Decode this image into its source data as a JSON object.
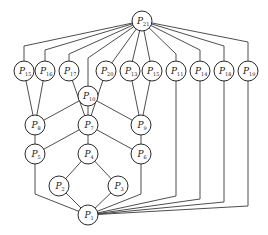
{
  "diagram": {
    "type": "hasse-diagram",
    "node_radius": 10,
    "nodes": [
      {
        "id": "P21",
        "base": "P",
        "sub": "21",
        "x": 142,
        "y": 21
      },
      {
        "id": "P15a",
        "base": "P",
        "sub": "15",
        "x": 24,
        "y": 71
      },
      {
        "id": "P16",
        "base": "P",
        "sub": "16",
        "x": 45,
        "y": 71
      },
      {
        "id": "P17",
        "base": "P",
        "sub": "17",
        "x": 69,
        "y": 71
      },
      {
        "id": "P20",
        "base": "P",
        "sub": "20",
        "x": 106,
        "y": 71
      },
      {
        "id": "P13",
        "base": "P",
        "sub": "13",
        "x": 130,
        "y": 71
      },
      {
        "id": "P15b",
        "base": "P",
        "sub": "15",
        "x": 152,
        "y": 71
      },
      {
        "id": "P11",
        "base": "P",
        "sub": "11",
        "x": 176,
        "y": 71
      },
      {
        "id": "P14",
        "base": "P",
        "sub": "14",
        "x": 200,
        "y": 71
      },
      {
        "id": "P18",
        "base": "P",
        "sub": "18",
        "x": 224,
        "y": 71
      },
      {
        "id": "P19",
        "base": "P",
        "sub": "19",
        "x": 248,
        "y": 71
      },
      {
        "id": "P10",
        "base": "P",
        "sub": "10",
        "x": 88,
        "y": 96
      },
      {
        "id": "P8",
        "base": "P",
        "sub": "8",
        "x": 35,
        "y": 125
      },
      {
        "id": "P7",
        "base": "P",
        "sub": "7",
        "x": 88,
        "y": 125
      },
      {
        "id": "P9",
        "base": "P",
        "sub": "9",
        "x": 141,
        "y": 125
      },
      {
        "id": "P5",
        "base": "P",
        "sub": "5",
        "x": 35,
        "y": 154
      },
      {
        "id": "P4",
        "base": "P",
        "sub": "4",
        "x": 88,
        "y": 154
      },
      {
        "id": "P6",
        "base": "P",
        "sub": "6",
        "x": 141,
        "y": 154
      },
      {
        "id": "P2",
        "base": "P",
        "sub": "2",
        "x": 59,
        "y": 186
      },
      {
        "id": "P3",
        "base": "P",
        "sub": "3",
        "x": 118,
        "y": 186
      },
      {
        "id": "P1",
        "base": "P",
        "sub": "1",
        "x": 88,
        "y": 215
      }
    ],
    "edges": [
      {
        "from": "P21",
        "to": "P15a",
        "path": [
          [
            142,
            21
          ],
          [
            24,
            46
          ],
          [
            24,
            71
          ]
        ]
      },
      {
        "from": "P21",
        "to": "P16",
        "path": [
          [
            142,
            21
          ],
          [
            45,
            50
          ],
          [
            45,
            71
          ]
        ]
      },
      {
        "from": "P21",
        "to": "P17",
        "path": [
          [
            142,
            21
          ],
          [
            69,
            54
          ],
          [
            69,
            71
          ]
        ]
      },
      {
        "from": "P21",
        "to": "P10",
        "path": [
          [
            142,
            21
          ],
          [
            88,
            58
          ],
          [
            88,
            96
          ]
        ]
      },
      {
        "from": "P21",
        "to": "P20",
        "path": [
          [
            142,
            21
          ],
          [
            106,
            71
          ]
        ]
      },
      {
        "from": "P21",
        "to": "P13",
        "path": [
          [
            142,
            21
          ],
          [
            130,
            71
          ]
        ]
      },
      {
        "from": "P21",
        "to": "P15b",
        "path": [
          [
            142,
            21
          ],
          [
            152,
            71
          ]
        ]
      },
      {
        "from": "P21",
        "to": "P11",
        "path": [
          [
            142,
            21
          ],
          [
            176,
            54
          ],
          [
            176,
            71
          ]
        ]
      },
      {
        "from": "P21",
        "to": "P14",
        "path": [
          [
            142,
            21
          ],
          [
            200,
            50
          ],
          [
            200,
            71
          ]
        ]
      },
      {
        "from": "P21",
        "to": "P18",
        "path": [
          [
            142,
            21
          ],
          [
            224,
            46
          ],
          [
            224,
            71
          ]
        ]
      },
      {
        "from": "P21",
        "to": "P19",
        "path": [
          [
            142,
            21
          ],
          [
            248,
            42
          ],
          [
            248,
            71
          ]
        ]
      },
      {
        "from": "P15a",
        "to": "P8",
        "path": [
          [
            24,
            71
          ],
          [
            35,
            125
          ]
        ]
      },
      {
        "from": "P16",
        "to": "P8",
        "path": [
          [
            45,
            71
          ],
          [
            35,
            125
          ]
        ]
      },
      {
        "from": "P17",
        "to": "P7",
        "path": [
          [
            69,
            71
          ],
          [
            88,
            125
          ]
        ]
      },
      {
        "from": "P20",
        "to": "P7",
        "path": [
          [
            106,
            71
          ],
          [
            88,
            125
          ]
        ]
      },
      {
        "from": "P10",
        "to": "P8",
        "path": [
          [
            88,
            96
          ],
          [
            35,
            125
          ]
        ]
      },
      {
        "from": "P10",
        "to": "P7",
        "path": [
          [
            88,
            96
          ],
          [
            88,
            125
          ]
        ]
      },
      {
        "from": "P10",
        "to": "P9",
        "path": [
          [
            88,
            96
          ],
          [
            141,
            125
          ]
        ]
      },
      {
        "from": "P13",
        "to": "P9",
        "path": [
          [
            130,
            71
          ],
          [
            141,
            125
          ]
        ]
      },
      {
        "from": "P15b",
        "to": "P9",
        "path": [
          [
            152,
            71
          ],
          [
            141,
            125
          ]
        ]
      },
      {
        "from": "P8",
        "to": "P5",
        "path": [
          [
            35,
            125
          ],
          [
            35,
            154
          ]
        ]
      },
      {
        "from": "P7",
        "to": "P5",
        "path": [
          [
            88,
            125
          ],
          [
            35,
            154
          ]
        ]
      },
      {
        "from": "P7",
        "to": "P4",
        "path": [
          [
            88,
            125
          ],
          [
            88,
            154
          ]
        ]
      },
      {
        "from": "P7",
        "to": "P6",
        "path": [
          [
            88,
            125
          ],
          [
            141,
            154
          ]
        ]
      },
      {
        "from": "P9",
        "to": "P6",
        "path": [
          [
            141,
            125
          ],
          [
            141,
            154
          ]
        ]
      },
      {
        "from": "P4",
        "to": "P2",
        "path": [
          [
            88,
            154
          ],
          [
            59,
            186
          ]
        ]
      },
      {
        "from": "P4",
        "to": "P3",
        "path": [
          [
            88,
            154
          ],
          [
            118,
            186
          ]
        ]
      },
      {
        "from": "P5",
        "to": "P1",
        "path": [
          [
            35,
            154
          ],
          [
            35,
            194
          ],
          [
            88,
            215
          ]
        ]
      },
      {
        "from": "P2",
        "to": "P1",
        "path": [
          [
            59,
            186
          ],
          [
            88,
            215
          ]
        ]
      },
      {
        "from": "P3",
        "to": "P1",
        "path": [
          [
            118,
            186
          ],
          [
            88,
            215
          ]
        ]
      },
      {
        "from": "P6",
        "to": "P1",
        "path": [
          [
            141,
            154
          ],
          [
            141,
            194
          ],
          [
            88,
            215
          ]
        ]
      },
      {
        "from": "P11",
        "to": "P1",
        "path": [
          [
            176,
            71
          ],
          [
            176,
            196
          ],
          [
            88,
            215
          ]
        ]
      },
      {
        "from": "P14",
        "to": "P1",
        "path": [
          [
            200,
            71
          ],
          [
            200,
            199
          ],
          [
            88,
            215
          ]
        ]
      },
      {
        "from": "P18",
        "to": "P1",
        "path": [
          [
            224,
            71
          ],
          [
            224,
            202
          ],
          [
            88,
            215
          ]
        ]
      },
      {
        "from": "P19",
        "to": "P1",
        "path": [
          [
            248,
            71
          ],
          [
            248,
            206
          ],
          [
            88,
            215
          ]
        ]
      }
    ]
  }
}
